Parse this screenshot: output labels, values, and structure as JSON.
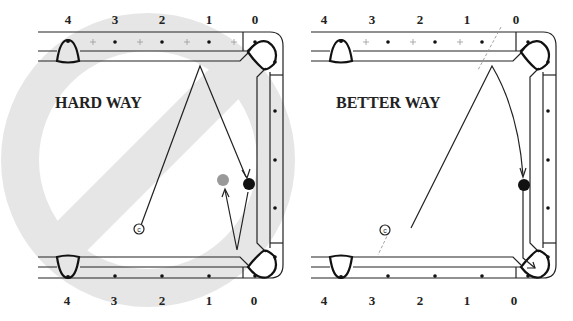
{
  "diagrams": [
    {
      "title": "HARD WAY",
      "prohibited": true,
      "top_labels": [
        "4",
        "3",
        "2",
        "1",
        "0"
      ],
      "bottom_labels": [
        "4",
        "3",
        "2",
        "1",
        "0"
      ],
      "cue_ball_label": "c",
      "object_ball_color": "#111111",
      "ghost_ball_color": "#999999"
    },
    {
      "title": "BETTER WAY",
      "prohibited": false,
      "top_labels": [
        "4",
        "3",
        "2",
        "1",
        "0"
      ],
      "bottom_labels": [
        "4",
        "3",
        "2",
        "1",
        "0"
      ],
      "cue_ball_label": "c",
      "object_ball_color": "#111111"
    }
  ],
  "colors": {
    "prohibition_sign": "#e6e6e6",
    "line": "#222222"
  }
}
